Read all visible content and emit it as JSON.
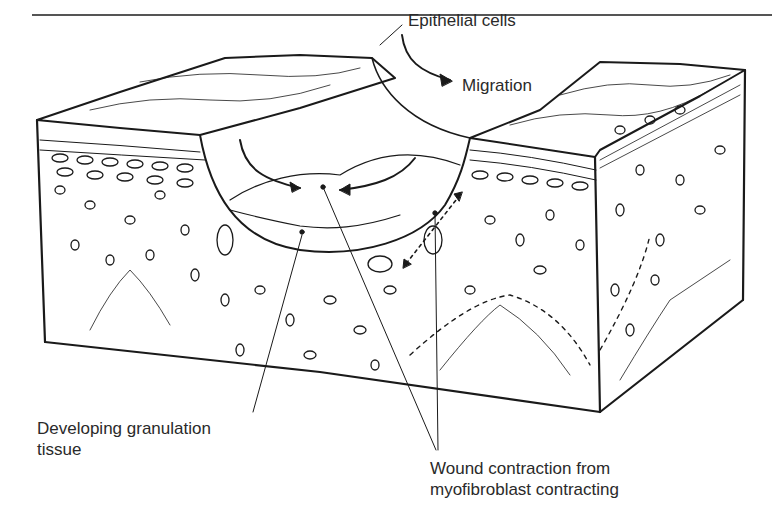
{
  "figure": {
    "labels": {
      "epithelial_cells": "Epithelial cells",
      "migration": "Migration",
      "granulation_line1": "Developing granulation",
      "granulation_line2": "tissue",
      "wound_line1": "Wound contraction from",
      "wound_line2": "myofibroblast contracting"
    },
    "colors": {
      "ink": "#1a1a1a",
      "background": "#ffffff",
      "text": "#2a2a2a"
    }
  }
}
